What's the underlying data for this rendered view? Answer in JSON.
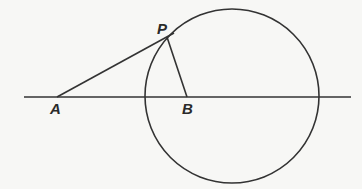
{
  "diagram": {
    "stroke_color": "#333333",
    "background": "#f7f7f5",
    "points": {
      "A": {
        "label": "A",
        "x": 57,
        "y": 97
      },
      "B": {
        "label": "B",
        "x": 187,
        "y": 97
      },
      "P": {
        "label": "P",
        "x": 167,
        "y": 37
      }
    },
    "circle": {
      "center": "B",
      "cx": 232,
      "cy": 96,
      "r": 87
    },
    "line": {
      "x1": 24,
      "y1": 97,
      "x2": 351,
      "y2": 97
    },
    "segments": [
      {
        "name": "AP",
        "from": "A",
        "to": "P"
      },
      {
        "name": "PB",
        "from": "P",
        "to": "B"
      }
    ]
  }
}
